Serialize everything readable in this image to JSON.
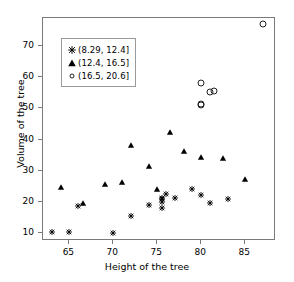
{
  "chart_data": {
    "type": "scatter",
    "title": "",
    "xlabel": "Height of the tree",
    "ylabel": "Volume of the tree",
    "xlim": [
      62.0,
      88.5
    ],
    "ylim": [
      7.5,
      79.0
    ],
    "xticks": [
      65,
      70,
      75,
      80,
      85
    ],
    "yticks": [
      10,
      20,
      30,
      40,
      50,
      60,
      70
    ],
    "grid": false,
    "legend_position": "top-left-inside",
    "series": [
      {
        "name": "(8.29, 12.4]",
        "marker": "star",
        "color": "#000000",
        "points": [
          [
            63.0,
            10.3
          ],
          [
            65.0,
            10.3
          ],
          [
            70.0,
            10.2
          ],
          [
            66.0,
            18.8
          ],
          [
            72.0,
            15.6
          ],
          [
            75.5,
            18.2
          ],
          [
            75.5,
            19.9
          ],
          [
            75.5,
            21.0
          ],
          [
            75.5,
            21.4
          ],
          [
            76.0,
            22.6
          ],
          [
            74.0,
            19.1
          ],
          [
            79.0,
            24.2
          ],
          [
            80.0,
            22.2
          ],
          [
            81.0,
            19.7
          ],
          [
            83.0,
            21.0
          ],
          [
            77.0,
            21.3
          ]
        ]
      },
      {
        "name": "(12.4, 16.5]",
        "marker": "triangle",
        "color": "#000000",
        "points": [
          [
            64.0,
            24.9
          ],
          [
            71.0,
            26.5
          ],
          [
            72.0,
            38.3
          ],
          [
            76.5,
            42.6
          ],
          [
            74.0,
            31.7
          ],
          [
            69.0,
            25.7
          ],
          [
            78.0,
            36.3
          ],
          [
            80.0,
            34.5
          ],
          [
            82.5,
            34.0
          ],
          [
            85.0,
            27.4
          ],
          [
            75.0,
            24.2
          ],
          [
            66.5,
            19.7
          ]
        ]
      },
      {
        "name": "(16.5, 20.6]",
        "marker": "circle",
        "color": "#000000",
        "points": [
          [
            80.0,
            58.3
          ],
          [
            80.0,
            51.5
          ],
          [
            80.0,
            51.0
          ],
          [
            81.0,
            55.4
          ],
          [
            81.5,
            55.7
          ],
          [
            87.0,
            77.0
          ]
        ]
      }
    ]
  },
  "axis": {
    "xlabel": "Height of the tree",
    "ylabel": "Volume of the tree",
    "xticklabels": [
      "65",
      "70",
      "75",
      "80",
      "85"
    ],
    "yticklabels": [
      "10",
      "20",
      "30",
      "40",
      "50",
      "60",
      "70"
    ]
  },
  "legend": {
    "items": [
      {
        "label": "(8.29, 12.4]",
        "marker": "star-marker"
      },
      {
        "label": "(12.4, 16.5]",
        "marker": "triangle-marker"
      },
      {
        "label": "(16.5, 20.6]",
        "marker": "circle-marker"
      }
    ]
  },
  "colors": {
    "marker": "#000000",
    "frame": "#7a7a7a",
    "background": "#ffffff"
  }
}
